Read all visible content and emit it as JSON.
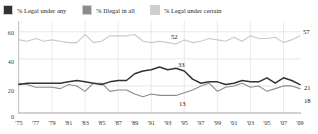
{
  "legend": {
    "items": [
      {
        "label": "% Legal under any",
        "color": "#333333",
        "icon": "legend-swatch-dark"
      },
      {
        "label": "% Illegal in all",
        "color": "#8c8c8c",
        "icon": "legend-swatch-mid"
      },
      {
        "label": "% Legal under certain",
        "color": "#c9c9c9",
        "icon": "legend-swatch-light"
      }
    ]
  },
  "annotations": [
    {
      "name": "annotation-52",
      "text": "52",
      "x": 171,
      "y": 33
    },
    {
      "name": "annotation-57",
      "text": "57",
      "x": 302,
      "y": 29
    },
    {
      "name": "annotation-33",
      "text": "33",
      "x": 178,
      "y": 62
    },
    {
      "name": "annotation-21",
      "text": "21",
      "x": 303,
      "y": 84
    },
    {
      "name": "annotation-13",
      "text": "13",
      "x": 179,
      "y": 100
    },
    {
      "name": "annotation-18",
      "text": "18",
      "x": 303,
      "y": 97
    }
  ],
  "chart_data": {
    "type": "line",
    "title": "",
    "xlabel": "",
    "ylabel": "",
    "ylim": [
      0,
      65
    ],
    "yticks": [
      0,
      20,
      40,
      60
    ],
    "ytick_labels": [
      "0",
      "20",
      "40",
      "60"
    ],
    "grid": true,
    "legend_position": "top",
    "xlim": [
      1975,
      2009
    ],
    "xticks": [
      1975,
      1977,
      1979,
      1981,
      1983,
      1985,
      1987,
      1989,
      1991,
      1993,
      1995,
      1997,
      1999,
      2001,
      2003,
      2005,
      2007,
      2009
    ],
    "xtick_labels": [
      "'75",
      "'77",
      "'79",
      "'81",
      "'83",
      "'85",
      "'87",
      "'89",
      "'91",
      "'93",
      "'95",
      "'97",
      "'99",
      "'01",
      "'03",
      "'05",
      "'07",
      "'09"
    ],
    "x": [
      1975,
      1976,
      1977,
      1978,
      1979,
      1980,
      1981,
      1982,
      1983,
      1984,
      1985,
      1986,
      1987,
      1988,
      1989,
      1990,
      1991,
      1992,
      1993,
      1994,
      1995,
      1996,
      1997,
      1998,
      1999,
      2000,
      2001,
      2002,
      2003,
      2004,
      2005,
      2006,
      2007,
      2008,
      2009
    ],
    "series": [
      {
        "name": "% Legal under certain",
        "color": "#c9c9c9",
        "end_label": "57",
        "values": [
          54,
          53,
          55,
          53,
          54,
          53,
          52,
          52,
          58,
          52,
          53,
          57,
          57,
          57,
          58,
          53,
          52,
          53,
          52,
          51,
          54,
          52,
          53,
          55,
          54,
          53,
          56,
          53,
          57,
          55,
          55,
          56,
          52,
          54,
          57
        ]
      },
      {
        "name": "% Legal under any",
        "color": "#333333",
        "end_label": "21",
        "values": [
          21,
          22,
          22,
          22,
          22,
          22,
          23,
          24,
          23,
          22,
          21,
          23,
          24,
          24,
          29,
          31,
          32,
          34,
          32,
          33,
          31,
          25,
          22,
          23,
          23,
          21,
          22,
          24,
          23,
          23,
          26,
          22,
          26,
          24,
          21
        ]
      },
      {
        "name": "% Illegal in all",
        "color": "#8c8c8c",
        "end_label": "18",
        "values": [
          22,
          21,
          19,
          19,
          19,
          18,
          21,
          20,
          16,
          22,
          22,
          16,
          17,
          17,
          14,
          12,
          14,
          13,
          13,
          13,
          15,
          17,
          20,
          22,
          16,
          19,
          20,
          22,
          19,
          20,
          16,
          18,
          20,
          20,
          18
        ]
      }
    ],
    "mid_labels": [
      {
        "series": "% Legal under certain",
        "value": 52,
        "year": 1993
      },
      {
        "series": "% Legal under any",
        "value": 33,
        "year": 1994
      },
      {
        "series": "% Illegal in all",
        "value": 13,
        "year": 1994
      }
    ]
  }
}
